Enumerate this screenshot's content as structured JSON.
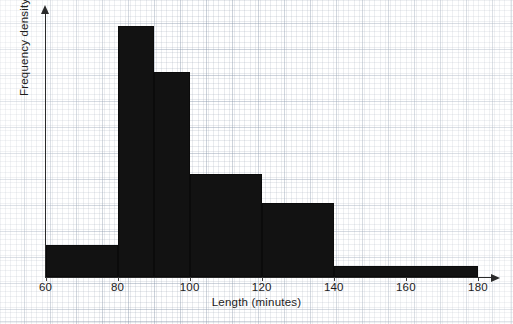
{
  "chart_data": {
    "type": "bar",
    "title": "",
    "subtitle": "",
    "xlabel": "Length (minutes)",
    "ylabel": "Frequency density",
    "grid": true,
    "legend": null,
    "legend_position": "none",
    "xlim": [
      60,
      180
    ],
    "ylim": [
      0,
      1
    ],
    "xticks": [
      60,
      80,
      100,
      120,
      140,
      160,
      180
    ],
    "xtick_labels": [
      "60",
      "80",
      "100",
      "120",
      "140",
      "160",
      "180"
    ],
    "yticks": [],
    "ytick_labels": [],
    "bar_color": "#121212",
    "axis_color": "#2a2a2a",
    "grid_color": "#96a0af",
    "background_color": "#ffffff",
    "bins": [
      {
        "label": "60-80",
        "x0": 60,
        "x1": 80,
        "width": 20,
        "frequency_density": 0.128
      },
      {
        "label": "80-90",
        "x0": 80,
        "x1": 90,
        "width": 10,
        "frequency_density": 1.0
      },
      {
        "label": "90-100",
        "x0": 90,
        "x1": 100,
        "width": 10,
        "frequency_density": 0.817
      },
      {
        "label": "100-120",
        "x0": 100,
        "x1": 120,
        "width": 20,
        "frequency_density": 0.41
      },
      {
        "label": "120-140",
        "x0": 120,
        "x1": 140,
        "width": 20,
        "frequency_density": 0.295
      },
      {
        "label": "140-180",
        "x0": 140,
        "x1": 180,
        "width": 40,
        "frequency_density": 0.044
      }
    ],
    "categories": [
      "60-80",
      "80-90",
      "90-100",
      "100-120",
      "120-140",
      "140-180"
    ],
    "values": [
      0.128,
      1.0,
      0.817,
      0.41,
      0.295,
      0.044
    ]
  }
}
